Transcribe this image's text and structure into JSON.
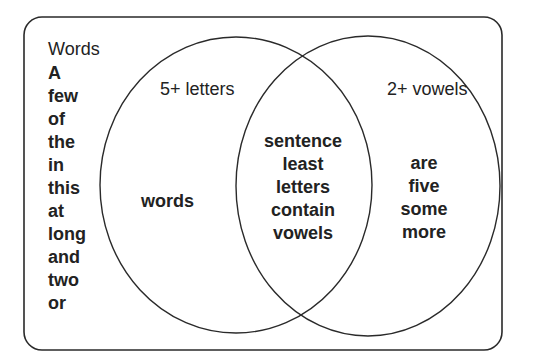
{
  "diagram": {
    "universe_label": "Words",
    "set_a_label": "5+ letters",
    "set_b_label": "2+ vowels",
    "outside_words": [
      "A",
      "few",
      "of",
      "the",
      "in",
      "this",
      "at",
      "long",
      "and",
      "two",
      "or"
    ],
    "only_a_words": [
      "words"
    ],
    "intersection_words": [
      "sentence",
      "least",
      "letters",
      "contain",
      "vowels"
    ],
    "only_b_words": [
      "are",
      "five",
      "some",
      "more"
    ]
  },
  "colors": {
    "stroke": "#2a2a2a",
    "text": "#222222",
    "background": "#ffffff"
  }
}
